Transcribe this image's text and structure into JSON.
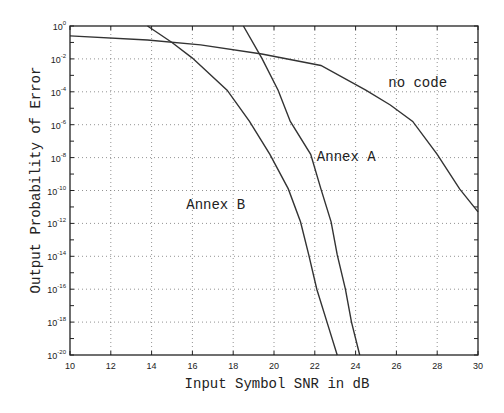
{
  "chart_data": {
    "type": "line",
    "title": "",
    "xlabel": "Input Symbol SNR in dB",
    "ylabel": "Output Probability of Error",
    "yscale": "log",
    "xlim": [
      10,
      30
    ],
    "ylim_exponent": [
      -20,
      0
    ],
    "grid": true,
    "legend": "none (inline curve annotations)",
    "x_ticks": [
      10,
      12,
      14,
      16,
      18,
      20,
      22,
      24,
      26,
      28,
      30
    ],
    "y_tick_exponents": [
      0,
      -2,
      -4,
      -6,
      -8,
      -10,
      -12,
      -14,
      -16,
      -18,
      -20
    ],
    "y_tick_labels": [
      "10^0",
      "10^-2",
      "10^-4",
      "10^-6",
      "10^-8",
      "10^-10",
      "10^-12",
      "10^-14",
      "10^-16",
      "10^-18",
      "10^-20"
    ],
    "series": [
      {
        "name": "no code",
        "x": [
          10,
          13.8,
          16.4,
          19.4,
          22.3,
          24.5,
          25.7,
          26.8,
          28,
          29.1,
          30
        ],
        "log10_y": [
          -0.6,
          -0.85,
          -1.15,
          -1.7,
          -2.4,
          -3.9,
          -4.8,
          -5.8,
          -7.8,
          -9.9,
          -11.3
        ]
      },
      {
        "name": "Annex B",
        "x": [
          13.8,
          15,
          16,
          17.7,
          18.8,
          19.8,
          20.7,
          21.3,
          21.7,
          22.1,
          22.6,
          23.1
        ],
        "log10_y": [
          0,
          -1.0,
          -1.95,
          -3.9,
          -5.8,
          -7.8,
          -9.9,
          -11.9,
          -13.9,
          -16,
          -18,
          -20
        ]
      },
      {
        "name": "Annex A",
        "x": [
          18.5,
          19.4,
          20.2,
          20.8,
          21.8,
          22.3,
          22.8,
          23.1,
          23.5,
          23.8,
          24.2
        ],
        "log10_y": [
          0,
          -1.95,
          -3.9,
          -5.8,
          -7.8,
          -9.9,
          -11.9,
          -13.9,
          -16,
          -18,
          -20
        ]
      }
    ],
    "annotations": [
      {
        "text": "no code",
        "x": 25.6,
        "log10_y": -3.4
      },
      {
        "text": "Annex A",
        "x": 22.1,
        "log10_y": -7.9
      },
      {
        "text": "Annex B",
        "x": 15.7,
        "log10_y": -10.8
      }
    ]
  },
  "layout": {
    "plot_left": 70,
    "plot_right": 478,
    "plot_top": 26,
    "plot_bottom": 355
  }
}
